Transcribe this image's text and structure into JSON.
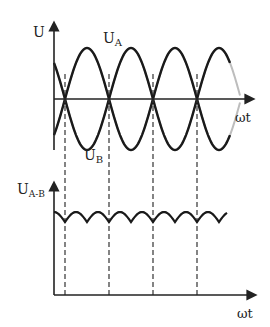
{
  "top_panel": {
    "y_axis_label": "U",
    "x_axis_label": "ωt",
    "curve_a_label": "U",
    "curve_a_sub": "A",
    "curve_b_label": "U",
    "curve_b_sub": "B"
  },
  "bottom_panel": {
    "y_axis_label": "U",
    "y_axis_sub": "A-B",
    "x_axis_label": "ωt"
  },
  "colors": {
    "envelope": "#1a1a1a",
    "component_sines": "#bdbdbd",
    "axes": "#222222",
    "dashed": "#333333"
  },
  "chart_data": {
    "type": "line",
    "title": "",
    "panels": [
      {
        "name": "phase voltages",
        "xlabel": "ωt",
        "ylabel": "U",
        "series": [
          {
            "name": "U_A (upper envelope, rectified max)",
            "style": "bold black"
          },
          {
            "name": "U_B (lower envelope, rectified min)",
            "style": "bold black"
          },
          {
            "name": "three-phase sinusoids",
            "style": "light gray"
          }
        ]
      },
      {
        "name": "output voltage",
        "xlabel": "ωt",
        "ylabel": "U_A-B",
        "series": [
          {
            "name": "U_A-B ripple",
            "style": "bold black"
          }
        ]
      }
    ],
    "dashed_markers_x": [
      65,
      109,
      153,
      197
    ]
  }
}
